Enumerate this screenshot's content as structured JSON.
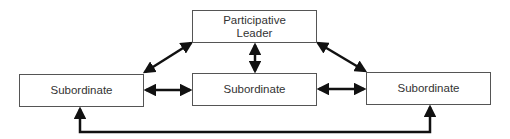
{
  "diagram": {
    "nodes": [
      {
        "id": "leader",
        "label": "Participative Leader",
        "line1": "Participative",
        "line2": "Leader"
      },
      {
        "id": "sub_left",
        "label": "Subordinate"
      },
      {
        "id": "sub_middle",
        "label": "Subordinate"
      },
      {
        "id": "sub_right",
        "label": "Subordinate"
      }
    ],
    "edges": [
      {
        "from": "leader",
        "to": "sub_left",
        "type": "bidirectional"
      },
      {
        "from": "leader",
        "to": "sub_middle",
        "type": "bidirectional"
      },
      {
        "from": "leader",
        "to": "sub_right",
        "type": "bidirectional"
      },
      {
        "from": "sub_left",
        "to": "sub_middle",
        "type": "bidirectional"
      },
      {
        "from": "sub_middle",
        "to": "sub_right",
        "type": "bidirectional"
      },
      {
        "from": "sub_left",
        "to": "sub_right",
        "type": "bidirectional",
        "route": "bottom"
      }
    ],
    "colors": {
      "line": "#111111",
      "border": "#555555",
      "text": "#333333"
    }
  }
}
